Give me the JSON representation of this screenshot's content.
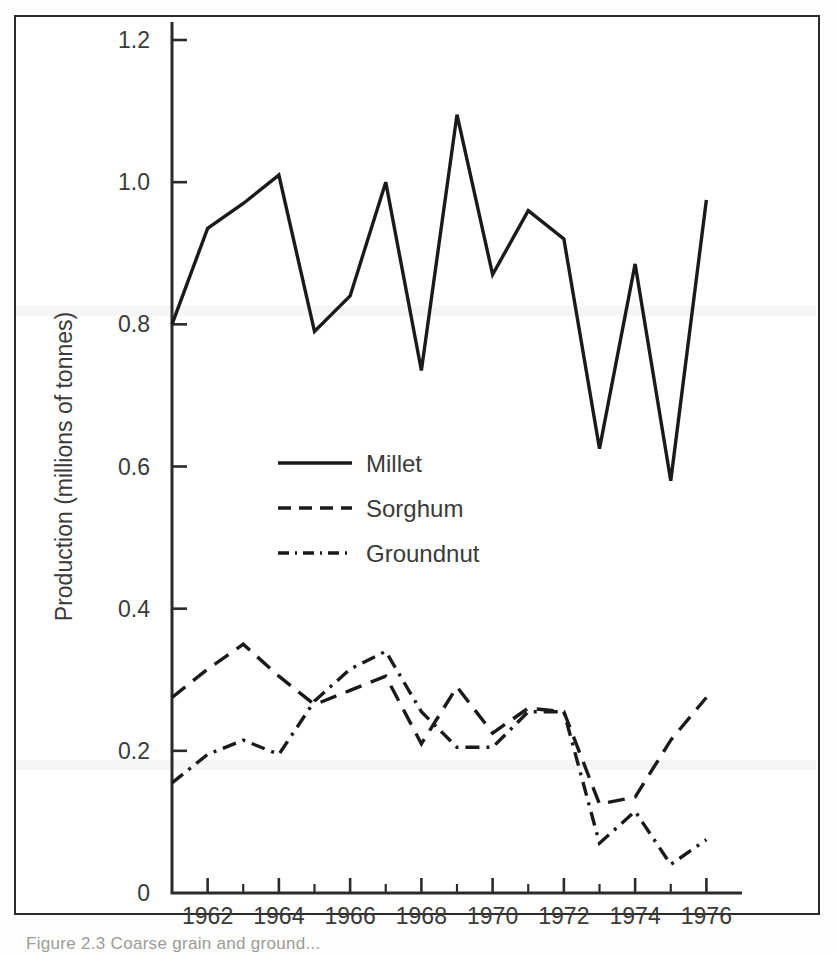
{
  "figure": {
    "caption": "Figure 2.3   Coarse grain and ground...",
    "background_color": "#ffffff",
    "ink_color": "#1a1a1a"
  },
  "chart_data": {
    "type": "line",
    "title": "",
    "xlabel": "",
    "ylabel": "Production (millions of tonnes)",
    "xlim": [
      1961,
      1977
    ],
    "ylim": [
      0,
      1.2
    ],
    "grid": false,
    "legend_position": "inside-left-middle",
    "y_ticks": [
      0,
      0.2,
      0.4,
      0.6,
      0.8,
      1.0,
      1.2
    ],
    "y_tick_labels": [
      "0",
      "0.2",
      "0.4",
      "0.6",
      "0.8",
      "1.0",
      "1.2"
    ],
    "x_ticks": [
      1961,
      1962,
      1963,
      1964,
      1965,
      1966,
      1967,
      1968,
      1969,
      1970,
      1971,
      1972,
      1973,
      1974,
      1975,
      1976,
      1977
    ],
    "x_tick_labels_major": [
      "1962",
      "1964",
      "1966",
      "1968",
      "1970",
      "1972",
      "1974",
      "1976"
    ],
    "x_major_years": [
      1962,
      1964,
      1966,
      1968,
      1970,
      1972,
      1974,
      1976
    ],
    "x": [
      1961,
      1962,
      1963,
      1964,
      1965,
      1966,
      1967,
      1968,
      1969,
      1970,
      1971,
      1972,
      1973,
      1974,
      1975,
      1976
    ],
    "series": [
      {
        "name": "Millet",
        "style": "solid",
        "values": [
          0.8,
          0.935,
          0.97,
          1.01,
          0.79,
          0.84,
          1.0,
          0.735,
          1.095,
          0.87,
          0.96,
          0.92,
          0.625,
          0.885,
          0.58,
          0.975
        ]
      },
      {
        "name": "Sorghum",
        "style": "dashed",
        "values": [
          0.275,
          0.315,
          0.35,
          0.305,
          0.265,
          0.285,
          0.305,
          0.21,
          0.29,
          0.225,
          0.26,
          0.255,
          0.125,
          0.135,
          0.215,
          0.275
        ]
      },
      {
        "name": "Groundnut",
        "style": "dashdot",
        "values": [
          0.155,
          0.195,
          0.215,
          0.195,
          0.27,
          0.315,
          0.34,
          0.255,
          0.205,
          0.205,
          0.255,
          0.255,
          0.07,
          0.115,
          0.04,
          0.075
        ]
      }
    ]
  },
  "legend": {
    "entries": [
      {
        "label": "Millet",
        "style": "solid"
      },
      {
        "label": "Sorghum",
        "style": "dashed"
      },
      {
        "label": "Groundnut",
        "style": "dashdot"
      }
    ]
  }
}
